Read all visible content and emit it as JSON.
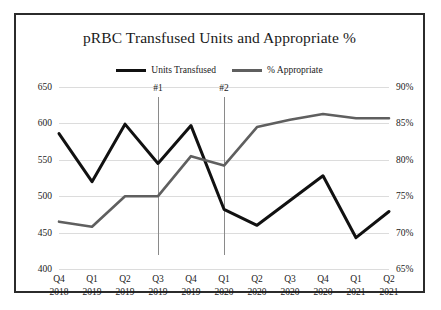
{
  "chart_data": {
    "type": "line",
    "title": "pRBC Transfused Units and Appropriate %",
    "xlabel": "",
    "ylabel": "",
    "grid": true,
    "legend_position": "top-center",
    "categories": [
      "Q4 2018",
      "Q1 2019",
      "Q2 2019",
      "Q3 2019",
      "Q4 2019",
      "Q1 2020",
      "Q2 2020",
      "Q3 2020",
      "Q4 2020",
      "Q1 2021",
      "Q2 2021"
    ],
    "category_lines": [
      {
        "quarter": "Q4",
        "year": "2018"
      },
      {
        "quarter": "Q1",
        "year": "2019"
      },
      {
        "quarter": "Q2",
        "year": "2019"
      },
      {
        "quarter": "Q3",
        "year": "2019"
      },
      {
        "quarter": "Q4",
        "year": "2019"
      },
      {
        "quarter": "Q1",
        "year": "2020"
      },
      {
        "quarter": "Q2",
        "year": "2020"
      },
      {
        "quarter": "Q3",
        "year": "2020"
      },
      {
        "quarter": "Q4",
        "year": "2020"
      },
      {
        "quarter": "Q1",
        "year": "2021"
      },
      {
        "quarter": "Q2",
        "year": "2021"
      }
    ],
    "series": [
      {
        "name": "Units Transfused",
        "axis": "left",
        "color": "#111111",
        "values": [
          586,
          520,
          599,
          545,
          597,
          482,
          460,
          494,
          528,
          443,
          479
        ]
      },
      {
        "name": "% Appropriate",
        "axis": "right",
        "color": "#5f5f5f",
        "values": [
          71.5,
          70.8,
          75.0,
          75.0,
          80.5,
          79.2,
          84.5,
          85.5,
          86.3,
          85.7,
          85.7
        ]
      }
    ],
    "left_axis": {
      "ticks": [
        650,
        600,
        550,
        500,
        450,
        400
      ],
      "ylim": [
        400,
        650
      ]
    },
    "right_axis": {
      "ticks": [
        "90%",
        "85%",
        "80%",
        "75%",
        "70%",
        "65%"
      ],
      "tick_values": [
        90,
        85,
        80,
        75,
        70,
        65
      ],
      "ylim": [
        65,
        90
      ]
    },
    "annotations": [
      {
        "label": "#1",
        "category_index": 3
      },
      {
        "label": "#2",
        "category_index": 5
      }
    ]
  }
}
